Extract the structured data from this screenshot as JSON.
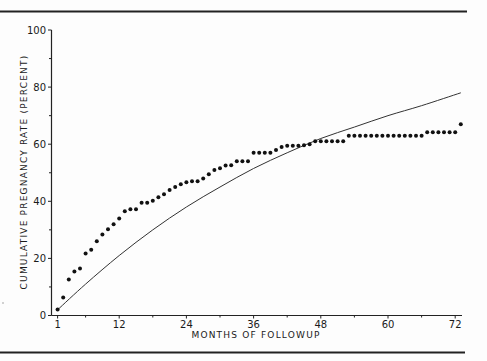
{
  "chart_data": {
    "type": "scatter",
    "title": "",
    "xlabel": "MONTHS OF FOLLOWUP",
    "ylabel": "CUMULATIVE PREGNANCY RATE (PERCENT)",
    "xlim": [
      0,
      72
    ],
    "ylim": [
      0,
      100
    ],
    "x_ticks": [
      1,
      12,
      24,
      36,
      48,
      60,
      72
    ],
    "x_minor_ticks": [
      6,
      18,
      30,
      42,
      54,
      66
    ],
    "y_ticks": [
      0,
      20,
      40,
      60,
      80,
      100
    ],
    "y_minor_ticks": [
      10,
      30,
      50,
      70,
      90
    ],
    "grid": false,
    "legend": null,
    "series": [
      {
        "name": "Observed cumulative pregnancy rate",
        "style": "dots",
        "x": [
          1,
          2,
          3,
          4,
          5,
          6,
          7,
          8,
          9,
          10,
          11,
          12,
          13,
          14,
          15,
          16,
          17,
          18,
          19,
          20,
          21,
          22,
          23,
          24,
          25,
          26,
          27,
          28,
          29,
          30,
          31,
          32,
          33,
          34,
          35,
          36,
          37,
          38,
          39,
          40,
          41,
          42,
          43,
          44,
          45,
          46,
          47,
          48,
          49,
          50,
          51,
          52,
          53,
          54,
          55,
          56,
          57,
          58,
          59,
          60,
          61,
          62,
          63,
          64,
          65,
          66,
          67,
          68,
          69,
          70,
          71,
          72,
          73
        ],
        "values": [
          2.1,
          6.3,
          12.6,
          15.4,
          16.5,
          21.7,
          23,
          26,
          28.4,
          30.2,
          32,
          34,
          36.5,
          37.2,
          37.2,
          39.5,
          39.5,
          40.2,
          41.4,
          42.5,
          44,
          45,
          46,
          46.7,
          47,
          47,
          48,
          49.5,
          51,
          51.6,
          52.5,
          52.6,
          54,
          54,
          54,
          57,
          57,
          57,
          57,
          58,
          59,
          59.5,
          59.5,
          59.5,
          59.6,
          60,
          61,
          61,
          61,
          61,
          61,
          61,
          63,
          63,
          63,
          63,
          63,
          63,
          63,
          63,
          63,
          63,
          63,
          63,
          63,
          63,
          64.2,
          64.2,
          64.2,
          64.2,
          64.2,
          64.2,
          67
        ]
      },
      {
        "name": "Expected (fitted) curve",
        "style": "line",
        "x": [
          1,
          6,
          12,
          18,
          24,
          30,
          36,
          42,
          48,
          54,
          60,
          66,
          73
        ],
        "values": [
          2,
          11,
          21,
          30,
          38,
          45,
          51.5,
          57,
          62,
          66,
          70,
          73.5,
          78
        ]
      }
    ]
  }
}
